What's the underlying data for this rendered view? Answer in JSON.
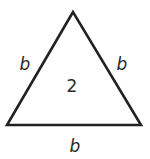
{
  "diagram": {
    "shape": "equilateral-triangle",
    "stroke_color": "#222222",
    "vertices": [
      [
        73,
        12
      ],
      [
        7,
        125
      ],
      [
        141,
        125
      ]
    ],
    "labels": {
      "left_side": "b",
      "right_side": "b",
      "bottom_side": "b",
      "center": "2"
    }
  }
}
